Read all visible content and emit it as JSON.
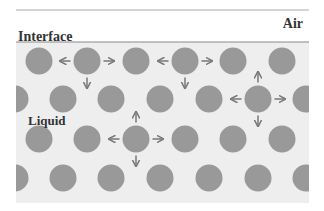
{
  "labels": {
    "air": "Air",
    "interface": "Interface",
    "liquid": "Liquid"
  },
  "colors": {
    "background": "#ffffff",
    "liquid_fill": "#eeeeee",
    "molecule": "#999999",
    "arrow": "#777777",
    "border": "#888888",
    "text": "#333333"
  },
  "box": {
    "x": 16,
    "y": 10,
    "width": 293,
    "height": 193
  },
  "interface_y": 42,
  "molecule_radius": 13.5,
  "rows": [
    {
      "y": 61,
      "x": [
        39,
        87,
        136,
        185,
        233,
        282
      ]
    },
    {
      "y": 99,
      "x": [
        15,
        63,
        111,
        160,
        209,
        258,
        306
      ]
    },
    {
      "y": 139,
      "x": [
        39,
        87,
        136,
        185,
        233,
        282
      ]
    },
    {
      "y": 178,
      "x": [
        15,
        63,
        111,
        160,
        209,
        258,
        306
      ]
    }
  ],
  "force_arrows": [
    {
      "molecule": [
        87,
        61
      ],
      "directions": [
        "left",
        "right",
        "down"
      ]
    },
    {
      "molecule": [
        185,
        61
      ],
      "directions": [
        "left",
        "right",
        "down"
      ]
    },
    {
      "molecule": [
        258,
        99
      ],
      "directions": [
        "up",
        "left",
        "right",
        "down"
      ]
    },
    {
      "molecule": [
        136,
        139
      ],
      "directions": [
        "up",
        "left",
        "right",
        "down"
      ]
    }
  ]
}
